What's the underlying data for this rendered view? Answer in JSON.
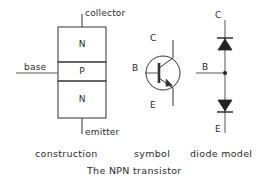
{
  "figure": {
    "title": "The NPN transistor",
    "stroke_color": "#333333",
    "background_color": "#ffffff",
    "text_color": "#2b2b2b"
  },
  "panels": {
    "construction": {
      "caption": "construction",
      "terminal_top_label": "collector",
      "terminal_bottom_label": "emitter",
      "terminal_side_label": "base",
      "layers": [
        {
          "letter": "N"
        },
        {
          "letter": "P"
        },
        {
          "letter": "N"
        }
      ]
    },
    "symbol": {
      "caption": "symbol",
      "collector_label": "C",
      "base_label": "B",
      "emitter_label": "E"
    },
    "diode_model": {
      "caption": "diode model",
      "collector_label": "C",
      "base_label": "B",
      "emitter_label": "E",
      "diodes": [
        {
          "name": "collector-base-diode",
          "direction": "up"
        },
        {
          "name": "base-emitter-diode",
          "direction": "down"
        }
      ]
    }
  }
}
